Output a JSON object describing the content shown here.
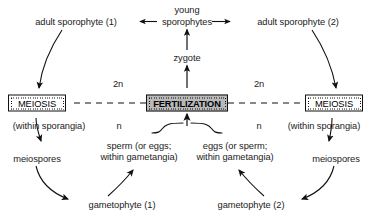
{
  "diagram": {
    "type": "cycle-diagram",
    "colors": {
      "line": "#111111",
      "text": "#1b1b1b",
      "background": "#ffffff",
      "fertilization_fill": "#b9b9b9"
    }
  },
  "nodes": {
    "adult_sporophyte_1": "adult sporophyte (1)",
    "young_sporophytes_line1": "young",
    "young_sporophytes_line2": "sporophytes",
    "adult_sporophyte_2": "adult sporophyte (2)",
    "zygote": "zygote",
    "meiosis_left": "MEIOSIS",
    "meiosis_right": "MEIOSIS",
    "fertilization": "FERTILIZATION",
    "within_sporangia_left": "(within sporangia)",
    "within_sporangia_right": "(within sporangia)",
    "meiospores_left": "meiospores",
    "meiospores_right": "meiospores",
    "sperm_line1": "sperm (or eggs;",
    "sperm_line2": "within gametangia)",
    "eggs_line1": "eggs (or sperm;",
    "eggs_line2": "within gametangia)",
    "gametophyte_1": "gametophyte (1)",
    "gametophyte_2": "gametophyte (2)"
  },
  "ploidy": {
    "diploid_left": "2n",
    "diploid_right": "2n",
    "haploid_left": "n",
    "haploid_right": "n"
  }
}
